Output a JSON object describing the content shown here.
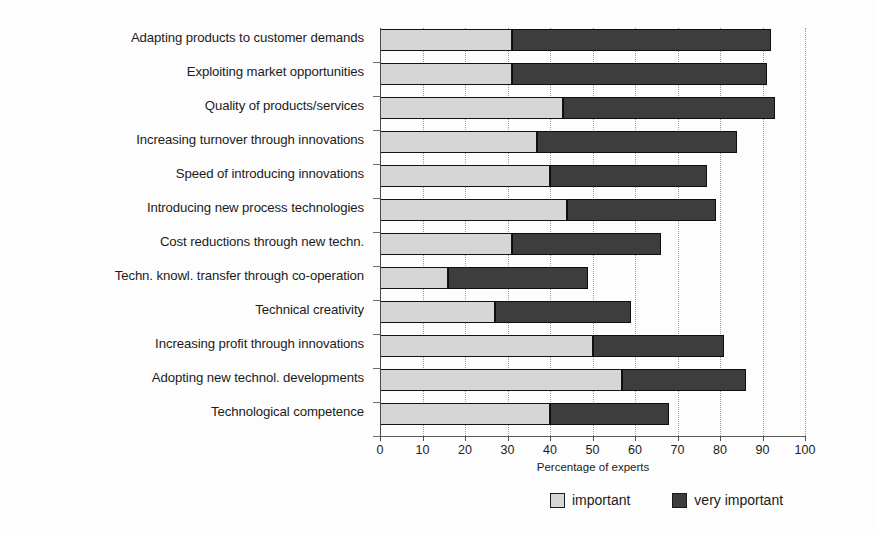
{
  "chart_data": {
    "type": "bar",
    "orientation": "horizontal",
    "stacked": true,
    "title": "",
    "xlabel": "Percentage of experts",
    "ylabel": "",
    "xlim": [
      0,
      100
    ],
    "xticks": [
      0,
      10,
      20,
      30,
      40,
      50,
      60,
      70,
      80,
      90,
      100
    ],
    "xtick_labels": [
      "0",
      "10",
      "20",
      "30",
      "40",
      "50",
      "60",
      "70",
      "80",
      "90",
      "100"
    ],
    "grid": "vertical-dotted",
    "legend_position": "bottom-right",
    "categories": [
      "Adapting products to customer demands",
      "Exploiting market opportunities",
      "Quality of products/services",
      "Increasing turnover through innovations",
      "Speed of introducing innovations",
      "Introducing new process technologies",
      "Cost reductions through new techn.",
      "Techn. knowl. transfer through co-operation",
      "Technical creativity",
      "Increasing profit through innovations",
      "Adopting new technol. developments",
      "Technological competence"
    ],
    "series": [
      {
        "name": "important",
        "color": "#d6d6d6",
        "values": [
          31,
          31,
          43,
          37,
          40,
          44,
          31,
          16,
          27,
          50,
          57,
          40
        ]
      },
      {
        "name": "very important",
        "color": "#3d3d3d",
        "values": [
          61,
          60,
          50,
          47,
          37,
          35,
          35,
          33,
          32,
          31,
          29,
          28
        ]
      }
    ],
    "totals": [
      92,
      91,
      93,
      84,
      77,
      79,
      66,
      49,
      59,
      81,
      86,
      68
    ]
  },
  "legend": {
    "items": [
      {
        "label": "important",
        "swatch": "light-gray-swatch"
      },
      {
        "label": "very important",
        "swatch": "dark-gray-swatch"
      }
    ]
  },
  "axis": {
    "x_title": "Percentage of experts"
  }
}
